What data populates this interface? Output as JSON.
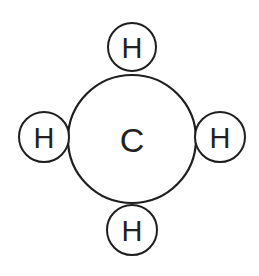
{
  "diagram": {
    "type": "molecule",
    "molecule": "methane",
    "center_atom": {
      "label": "C",
      "cx": 132,
      "cy": 139,
      "r": 64,
      "font_size": 34
    },
    "outer_atoms": [
      {
        "label": "H",
        "position": "top",
        "cx": 132,
        "cy": 47,
        "r": 24,
        "font_size": 29
      },
      {
        "label": "H",
        "position": "left",
        "cx": 44,
        "cy": 137,
        "r": 25,
        "font_size": 29
      },
      {
        "label": "H",
        "position": "right",
        "cx": 220,
        "cy": 137,
        "r": 25,
        "font_size": 29
      },
      {
        "label": "H",
        "position": "bottom",
        "cx": 132,
        "cy": 230,
        "r": 25,
        "font_size": 29
      }
    ],
    "stroke_color": "#1e1e1e",
    "background": "#ffffff"
  }
}
